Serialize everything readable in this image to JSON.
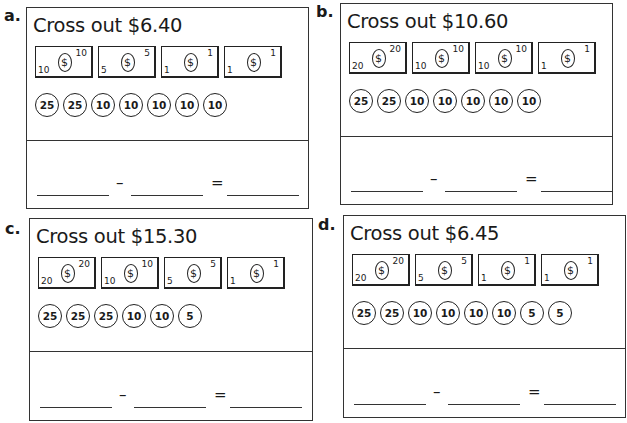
{
  "problems": [
    {
      "label": "a.",
      "title": "Cross out $6.40",
      "bills": [
        {
          "value": "10",
          "icon": "dollar-seal-icon"
        },
        {
          "value": "5",
          "icon": "dollar-seal-icon"
        },
        {
          "value": "1",
          "icon": "dollar-seal-icon"
        },
        {
          "value": "1",
          "icon": "dollar-seal-icon"
        }
      ],
      "coins": [
        "25",
        "25",
        "10",
        "10",
        "10",
        "10",
        "10"
      ],
      "equation": {
        "minus": "–",
        "equals": "="
      }
    },
    {
      "label": "b.",
      "title": "Cross out $10.60",
      "bills": [
        {
          "value": "20",
          "icon": "dollar-seal-icon"
        },
        {
          "value": "10",
          "icon": "dollar-seal-icon"
        },
        {
          "value": "10",
          "icon": "dollar-seal-icon"
        },
        {
          "value": "1",
          "icon": "dollar-seal-icon"
        }
      ],
      "coins": [
        "25",
        "25",
        "10",
        "10",
        "10",
        "10",
        "10"
      ],
      "equation": {
        "minus": "–",
        "equals": "="
      }
    },
    {
      "label": "c.",
      "title": "Cross out $15.30",
      "bills": [
        {
          "value": "20",
          "icon": "dollar-seal-icon"
        },
        {
          "value": "10",
          "icon": "dollar-seal-icon"
        },
        {
          "value": "5",
          "icon": "dollar-seal-icon"
        },
        {
          "value": "1",
          "icon": "dollar-seal-icon"
        }
      ],
      "coins": [
        "25",
        "25",
        "25",
        "10",
        "10",
        "5"
      ],
      "equation": {
        "minus": "–",
        "equals": "="
      }
    },
    {
      "label": "d.",
      "title": "Cross out $6.45",
      "bills": [
        {
          "value": "20",
          "icon": "dollar-seal-icon"
        },
        {
          "value": "5",
          "icon": "dollar-seal-icon"
        },
        {
          "value": "1",
          "icon": "dollar-seal-icon"
        },
        {
          "value": "1",
          "icon": "dollar-seal-icon"
        }
      ],
      "coins": [
        "25",
        "25",
        "10",
        "10",
        "10",
        "10",
        "5",
        "5"
      ],
      "equation": {
        "minus": "–",
        "equals": "="
      }
    }
  ],
  "dollar_symbol": "$"
}
